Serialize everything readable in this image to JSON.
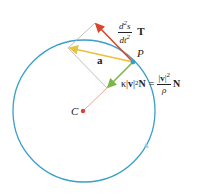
{
  "diagram": {
    "colors": {
      "circle": "#3a9fc8",
      "tangential_arrow": "#d9452a",
      "acceleration_arrow": "#e8c23a",
      "normal_arrow": "#7ab648",
      "radius_line": "#e89a8a",
      "construction_lines": "#b0b0b0",
      "center_dot": "#d9452a",
      "point_P": "#3a9fc8"
    },
    "labels": {
      "tangential_num_d": "d",
      "tangential_num_exp": "2",
      "tangential_num_s": "s",
      "tangential_den_dt": "dt",
      "tangential_den_exp": "2",
      "tangential_vec": "T",
      "acceleration": "a",
      "point": "P",
      "center": "C",
      "normal_kappa": "κ|",
      "normal_v": "v",
      "normal_bar": "|",
      "normal_exp": "2",
      "normal_N": "N",
      "equals": "=",
      "normal_frac_num_bar1": "|",
      "normal_frac_num_v": "v",
      "normal_frac_num_bar2": "|",
      "normal_frac_num_exp": "2",
      "normal_frac_den": "ρ",
      "normal_frac_N": "N"
    }
  }
}
